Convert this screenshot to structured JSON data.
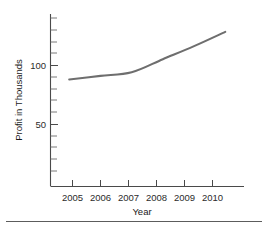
{
  "chart_data": {
    "type": "line",
    "title": "",
    "xlabel": "Year",
    "ylabel": "Profit in Thousands",
    "categories": [
      "2005",
      "2006",
      "2007",
      "2008",
      "2009",
      "2010"
    ],
    "x": [
      2005,
      2006,
      2007,
      2008,
      2009,
      2010
    ],
    "values": [
      90,
      93,
      96,
      107,
      118,
      130
    ],
    "series": [
      {
        "name": "Profit",
        "values": [
          90,
          93,
          96,
          107,
          118,
          130
        ],
        "color": "#6e6e6e"
      }
    ],
    "xlim": [
      2004.4,
      2010.6
    ],
    "ylim": [
      0,
      145
    ],
    "y_tick_labels": [
      "50",
      "100"
    ],
    "y_tick_values": [
      50,
      100
    ],
    "y_minor_tick_values": [
      10,
      20,
      30,
      40,
      60,
      70,
      80,
      90,
      110,
      120,
      130,
      140
    ],
    "x_tick_labels": [
      "2005",
      "2006",
      "2007",
      "2008",
      "2009",
      "2010"
    ],
    "grid": false,
    "legend": false,
    "legend_position": "none",
    "axis_color": "#4a4a4a",
    "line_color": "#6e6e6e",
    "background_color": "#ffffff"
  },
  "axis_labels": {
    "y": "Profit in Thousands",
    "x": "Year"
  }
}
